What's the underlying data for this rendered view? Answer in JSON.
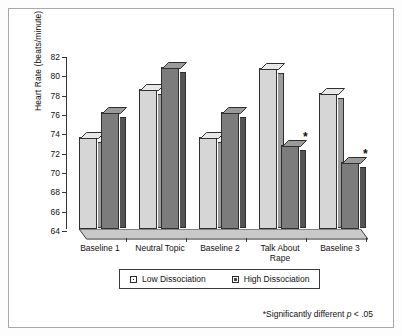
{
  "chart_data": {
    "type": "bar",
    "title": "",
    "xlabel": "",
    "ylabel": "Heart Rate (beats/minute)",
    "ylim": [
      64,
      82
    ],
    "yticks": [
      64,
      66,
      68,
      70,
      72,
      74,
      76,
      78,
      80,
      82
    ],
    "grid": false,
    "legend_position": "bottom-center",
    "categories": [
      "Baseline 1",
      "Neutral Topic",
      "Baseline 2",
      "Talk About\nRape",
      "Baseline 3"
    ],
    "series": [
      {
        "name": "Low Dissociation",
        "color": "#d6d6d6",
        "values": [
          73.5,
          78.5,
          73.5,
          80.7,
          78.1
        ]
      },
      {
        "name": "High Dissociation",
        "color": "#7c7c7c",
        "values": [
          76.1,
          80.8,
          76.1,
          72.7,
          70.9
        ]
      }
    ],
    "annotations": [
      {
        "text": "*",
        "series": "High Dissociation",
        "category": "Talk About\nRape"
      },
      {
        "text": "*",
        "series": "High Dissociation",
        "category": "Baseline 3"
      }
    ],
    "footnote": "*Significantly different p < .05",
    "footnote_prefix": "*Significantly different ",
    "footnote_italic": "p",
    "footnote_suffix": " < .05"
  },
  "legend": {
    "items": [
      {
        "label": "Low Dissociation",
        "swatch": "low"
      },
      {
        "label": "High Dissociation",
        "swatch": "high"
      }
    ]
  }
}
